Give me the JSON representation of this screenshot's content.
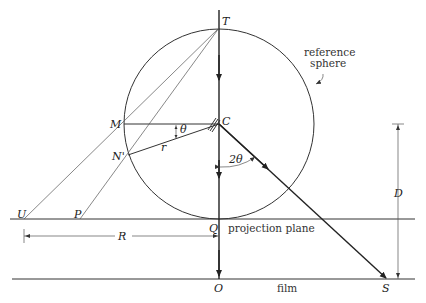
{
  "diagram": {
    "points": {
      "T": "T",
      "C": "C",
      "M": "M",
      "N_prime": "N'",
      "Q": "Q",
      "O": "O",
      "S": "S",
      "U": "U",
      "P": "P"
    },
    "symbols": {
      "theta": "θ",
      "two_theta": "2θ",
      "r": "r",
      "R": "R",
      "D": "D"
    },
    "text": {
      "reference_sphere_line1": "reference",
      "reference_sphere_line2": "sphere",
      "projection_plane": "projection plane",
      "film": "film"
    }
  }
}
